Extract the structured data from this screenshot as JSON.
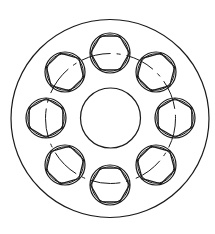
{
  "diagram": {
    "type": "technical-drawing",
    "stroke_color": "#1a1a1a",
    "background": "#ffffff",
    "outer_circle": {
      "cx": 110,
      "cy": 118.5,
      "r": 99
    },
    "inner_bore": {
      "cx": 110.5,
      "cy": 118,
      "r": 30
    },
    "pitch_circle": {
      "cx": 110.5,
      "cy": 118.5,
      "r": 65,
      "style": "dash-dot"
    },
    "pockets": [
      {
        "name": "pocket-top",
        "cx": 110,
        "cy": 53,
        "r": 20
      },
      {
        "name": "pocket-top-right",
        "cx": 156,
        "cy": 72,
        "r": 20
      },
      {
        "name": "pocket-right",
        "cx": 175,
        "cy": 118,
        "r": 20
      },
      {
        "name": "pocket-bottom-right",
        "cx": 156,
        "cy": 165,
        "r": 20
      },
      {
        "name": "pocket-bottom",
        "cx": 110,
        "cy": 185,
        "r": 20
      },
      {
        "name": "pocket-bottom-left",
        "cx": 65,
        "cy": 165,
        "r": 20
      },
      {
        "name": "pocket-left",
        "cx": 46,
        "cy": 118,
        "r": 20
      },
      {
        "name": "pocket-top-left",
        "cx": 65,
        "cy": 72,
        "r": 20
      }
    ],
    "pocket_count": 8,
    "hexagon_inscribed": true
  }
}
